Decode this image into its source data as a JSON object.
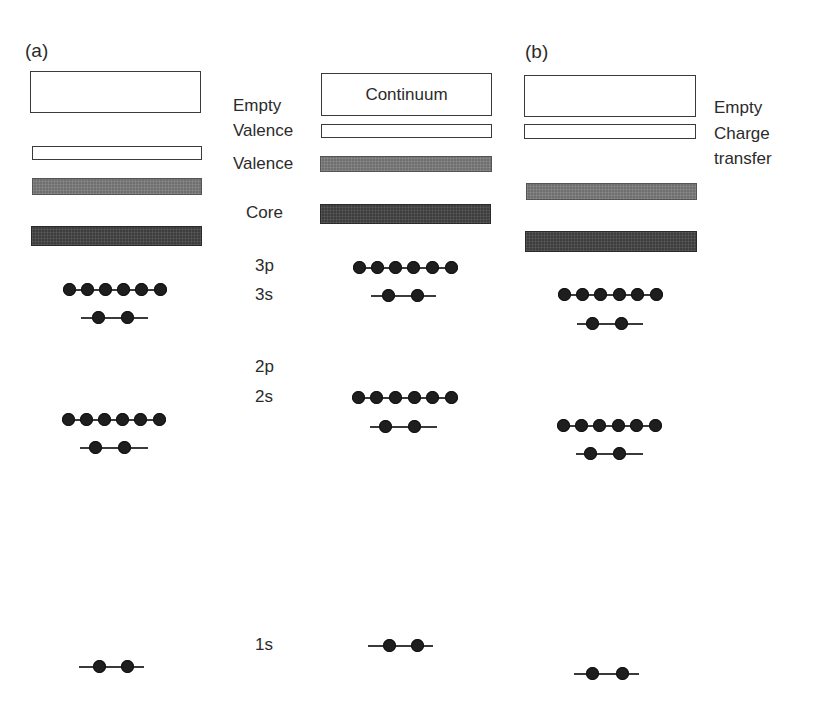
{
  "panels": {
    "a": {
      "label": "(a)"
    },
    "b": {
      "label": "(b)"
    }
  },
  "band_labels_middle": {
    "empty": "Empty",
    "valence_empty": "Valence",
    "valence": "Valence",
    "core": "Core"
  },
  "band_labels_right": {
    "empty": "Empty",
    "charge": "Charge",
    "transfer": "transfer"
  },
  "middle_column": {
    "continuum_label": "Continuum"
  },
  "orbital_labels": {
    "p3": "3p",
    "s3": "3s",
    "p2": "2p",
    "s2": "2s",
    "s1": "1s"
  },
  "orbitals": [
    {
      "name": "3p",
      "electrons": 6
    },
    {
      "name": "3s",
      "electrons": 2
    },
    {
      "name": "2p",
      "electrons": 6
    },
    {
      "name": "2s",
      "electrons": 2
    },
    {
      "name": "1s",
      "electrons": 2
    }
  ],
  "colors": {
    "empty_band_fill": "#ffffff",
    "valence_band_fill": "#6f6f6f",
    "core_band_fill": "#3d3d3d",
    "electron": "#1e1e1e",
    "text": "#2b2b2b"
  }
}
